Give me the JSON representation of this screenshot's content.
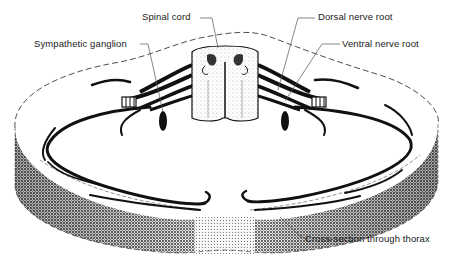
{
  "diagram": {
    "labels": {
      "spinal_cord": "Spinal cord",
      "sympathetic_ganglion": "Sympathetic ganglion",
      "dorsal_nerve_root": "Dorsal nerve root",
      "ventral_nerve_root": "Ventral nerve root",
      "cross_section": "Cross-section through thorax"
    },
    "colors": {
      "ink": "#111111",
      "background": "#ffffff",
      "stipple": "#9a9a9a",
      "leader": "#555555"
    }
  }
}
